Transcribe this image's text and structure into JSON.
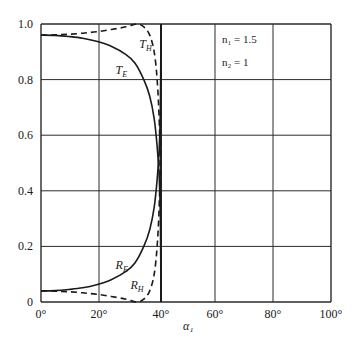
{
  "chart_data": {
    "type": "line",
    "title": "",
    "xlabel": "α₁",
    "ylabel": "",
    "xlim": [
      0,
      100
    ],
    "ylim": [
      0,
      1.0
    ],
    "grid": true,
    "x_ticks": [
      "0°",
      "20°",
      "40°",
      "60°",
      "80°",
      "100°"
    ],
    "y_ticks": [
      "0",
      "0.2",
      "0.4",
      "0.6",
      "0.8",
      "1.0"
    ],
    "annotations": [
      "n₁ = 1.5",
      "n₂ = 1"
    ],
    "critical_angle_deg": 41.8,
    "series": [
      {
        "name": "T_H",
        "style": "dashed",
        "x": [
          0,
          5,
          10,
          15,
          20,
          25,
          30,
          33.7,
          36,
          38,
          39.5,
          40.5,
          41.2,
          41.6,
          41.8
        ],
        "y": [
          0.96,
          0.961,
          0.963,
          0.967,
          0.972,
          0.98,
          0.99,
          1.0,
          0.99,
          0.96,
          0.9,
          0.8,
          0.65,
          0.45,
          0.0
        ]
      },
      {
        "name": "T_E",
        "style": "solid",
        "x": [
          0,
          5,
          10,
          15,
          20,
          25,
          30,
          33,
          36,
          38,
          39.5,
          40.5,
          41.2,
          41.6,
          41.8
        ],
        "y": [
          0.96,
          0.959,
          0.955,
          0.949,
          0.938,
          0.92,
          0.89,
          0.86,
          0.8,
          0.74,
          0.66,
          0.56,
          0.45,
          0.3,
          0.0
        ]
      },
      {
        "name": "R_E",
        "style": "solid",
        "x": [
          0,
          5,
          10,
          15,
          20,
          25,
          30,
          33,
          36,
          38,
          39.5,
          40.5,
          41.2,
          41.6,
          41.8
        ],
        "y": [
          0.04,
          0.041,
          0.045,
          0.051,
          0.062,
          0.08,
          0.11,
          0.14,
          0.2,
          0.26,
          0.34,
          0.44,
          0.55,
          0.7,
          1.0
        ]
      },
      {
        "name": "R_H",
        "style": "dashed",
        "x": [
          0,
          5,
          10,
          15,
          20,
          25,
          30,
          33.7,
          36,
          38,
          39.5,
          40.5,
          41.2,
          41.6,
          41.8
        ],
        "y": [
          0.04,
          0.039,
          0.037,
          0.033,
          0.028,
          0.02,
          0.01,
          0.0,
          0.01,
          0.04,
          0.1,
          0.2,
          0.35,
          0.55,
          1.0
        ]
      }
    ],
    "curve_labels": [
      {
        "text": "T",
        "sub": "H",
        "x": 34.5,
        "y": 0.915
      },
      {
        "text": "T",
        "sub": "E",
        "x": 26.5,
        "y": 0.82
      },
      {
        "text": "R",
        "sub": "E",
        "x": 26.5,
        "y": 0.12
      },
      {
        "text": "R",
        "sub": "H",
        "x": 31.5,
        "y": 0.045
      }
    ]
  },
  "labels": {
    "n1": "n₁ = 1.5",
    "n2": "n₂ = 1",
    "xaxis": "α₁"
  },
  "style": {
    "line_color": "#1a1a1a",
    "grid_color": "#2a2a2a",
    "background": "#ffffff"
  }
}
